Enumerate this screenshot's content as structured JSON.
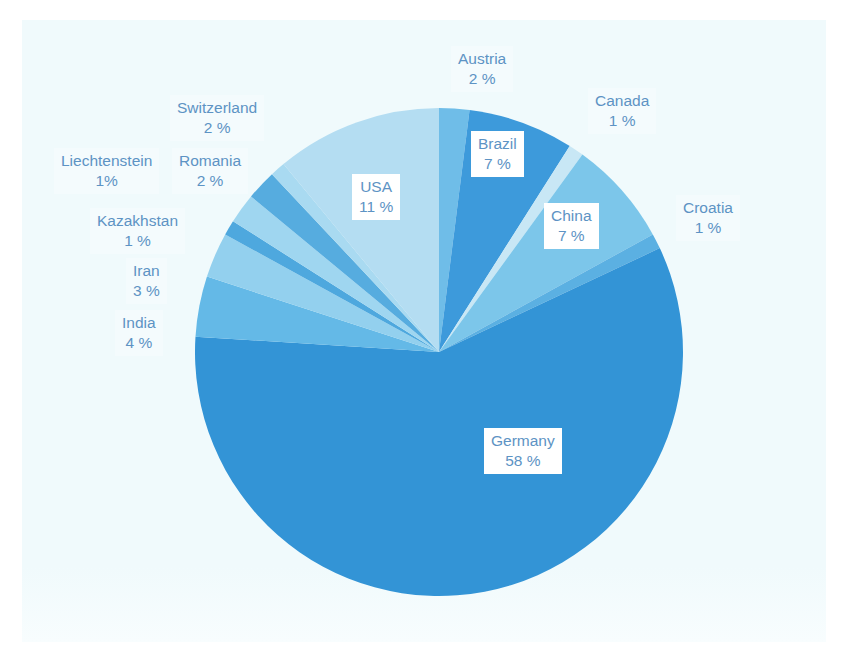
{
  "figure": {
    "background_color": "#f0fafc",
    "page_color": "#ffffff",
    "label_text_color": "#5d93c4",
    "caption": ""
  },
  "chart_data": {
    "type": "pie",
    "title": "",
    "subtitle": "",
    "xlabel": "",
    "ylabel": "",
    "legend_position": "none",
    "grid": false,
    "unit": "%",
    "start_angle_deg": 0,
    "direction": "clockwise",
    "categories": [
      "Austria",
      "Brazil",
      "Canada",
      "China",
      "Croatia",
      "Germany",
      "India",
      "Iran",
      "Kazakhstan",
      "Romania",
      "Switzerland",
      "Liechtenstein",
      "USA"
    ],
    "values": [
      2,
      7,
      1,
      7,
      1,
      58,
      4,
      3,
      1,
      2,
      2,
      1,
      11
    ],
    "slices": [
      {
        "name": "Austria",
        "value": 2,
        "label_name": "Austria",
        "label_pct": "2 %",
        "color": "#6fbde8"
      },
      {
        "name": "Brazil",
        "value": 7,
        "label_name": "Brazil",
        "label_pct": "7 %",
        "color": "#3d9adb"
      },
      {
        "name": "Canada",
        "value": 1,
        "label_name": "Canada",
        "label_pct": "1 %",
        "color": "#c8e7f5"
      },
      {
        "name": "China",
        "value": 7,
        "label_name": "China",
        "label_pct": "7 %",
        "color": "#7cc6ea"
      },
      {
        "name": "Croatia",
        "value": 1,
        "label_name": "Croatia",
        "label_pct": "1 %",
        "color": "#5bb0e2"
      },
      {
        "name": "Germany",
        "value": 58,
        "label_name": "Germany",
        "label_pct": "58 %",
        "color": "#3394d6"
      },
      {
        "name": "India",
        "value": 4,
        "label_name": "India",
        "label_pct": "4 %",
        "color": "#64b9e7"
      },
      {
        "name": "Iran",
        "value": 3,
        "label_name": "Iran",
        "label_pct": "3 %",
        "color": "#93d0ee"
      },
      {
        "name": "Kazakhstan",
        "value": 1,
        "label_name": "Kazakhstan",
        "label_pct": "1 %",
        "color": "#4ea8de"
      },
      {
        "name": "Romania",
        "value": 2,
        "label_name": "Romania",
        "label_pct": "2 %",
        "color": "#9fd6f0"
      },
      {
        "name": "Switzerland",
        "value": 2,
        "label_name": "Switzerland",
        "label_pct": "2 %",
        "color": "#56acdf"
      },
      {
        "name": "Liechtenstein",
        "value": 1,
        "label_name": "Liechtenstein",
        "label_pct": "1%",
        "color": "#a9daf1"
      },
      {
        "name": "USA",
        "value": 11,
        "label_name": "USA",
        "label_pct": "11 %",
        "color": "#b4ddf2"
      }
    ]
  }
}
